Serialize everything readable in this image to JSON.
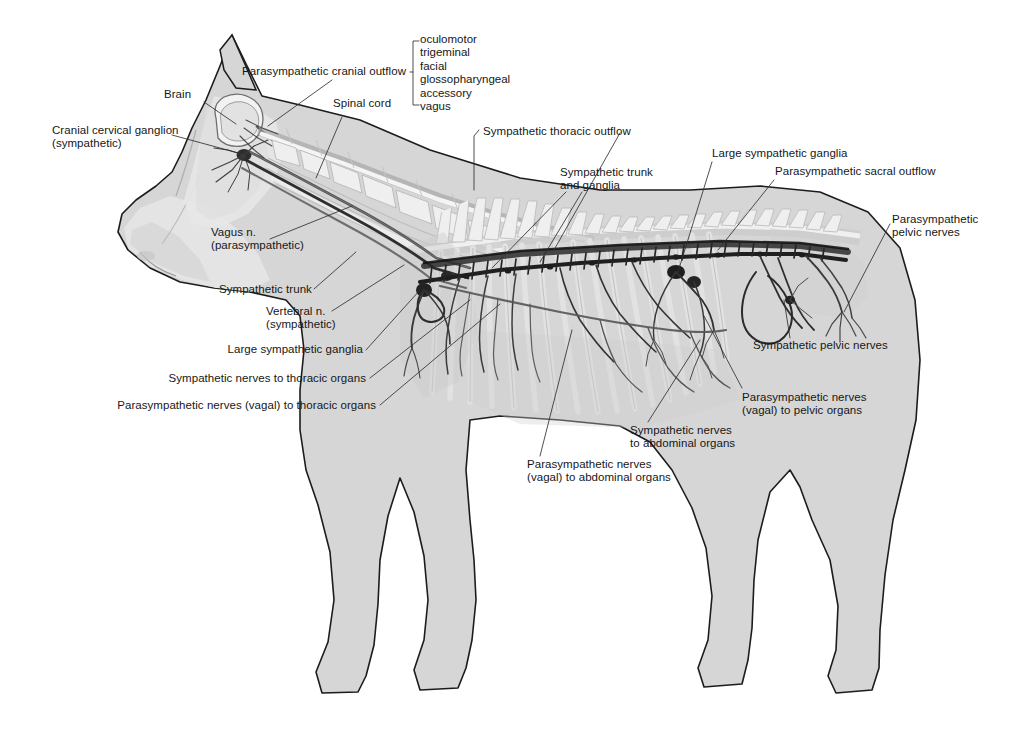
{
  "figure": {
    "background_color": "#ffffff",
    "body_fill": "#d6d6d6",
    "outline_color": "#1a1a1a",
    "nerve_color": "#3a3a3a",
    "leader_color": "#303030",
    "text_color": "#171717"
  },
  "cranial_nerves": {
    "items": [
      "oculomotor",
      "trigeminal",
      "facial",
      "glossopharyngeal",
      "accessory",
      "vagus"
    ]
  },
  "labels": {
    "parasympathetic_cranial_outflow": "Parasympathetic cranial outflow",
    "brain": "Brain",
    "spinal_cord": "Spinal cord",
    "cranial_cervical_ganglion_l1": "Cranial cervical ganglion",
    "cranial_cervical_ganglion_l2": "(sympathetic)",
    "vagus_n_l1": "Vagus n.",
    "vagus_n_l2": "(parasympathetic)",
    "sympathetic_trunk": "Sympathetic trunk",
    "vertebral_n_l1": "Vertebral n.",
    "vertebral_n_l2": "(sympathetic)",
    "large_sympathetic_ganglia_left": "Large sympathetic ganglia",
    "sympathetic_nerves_thoracic": "Sympathetic nerves to thoracic organs",
    "parasympathetic_nerves_thoracic": "Parasympathetic nerves (vagal) to thoracic organs",
    "sympathetic_thoracic_outflow": "Sympathetic thoracic outflow",
    "sympathetic_trunk_and_ganglia_l1": "Sympathetic trunk",
    "sympathetic_trunk_and_ganglia_l2": "and ganglia",
    "large_sympathetic_ganglia_right": "Large sympathetic ganglia",
    "parasympathetic_sacral_outflow": "Parasympathetic sacral outflow",
    "parasympathetic_pelvic_nerves_l1": "Parasympathetic",
    "parasympathetic_pelvic_nerves_l2": "pelvic nerves",
    "sympathetic_pelvic_nerves": "Sympathetic pelvic nerves",
    "parasympathetic_pelvic_organs_l1": "Parasympathetic nerves",
    "parasympathetic_pelvic_organs_l2": "(vagal) to pelvic organs",
    "sympathetic_abdominal_l1": "Sympathetic nerves",
    "sympathetic_abdominal_l2": "to abdominal organs",
    "parasympathetic_abdominal_l1": "Parasympathetic nerves",
    "parasympathetic_abdominal_l2": "(vagal) to abdominal organs"
  }
}
